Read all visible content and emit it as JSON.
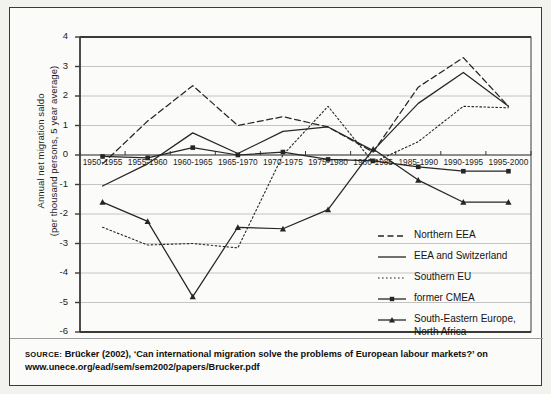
{
  "chart_data": {
    "type": "line",
    "title": "",
    "xlabel": "",
    "ylabel": "Annual net migration saldo (per thousand persons, 5 year average)",
    "ylabel_line1": "Annual net migration saldo",
    "ylabel_line2": "(per thousand persons, 5 year average)",
    "categories": [
      "1950-1955",
      "1955-1960",
      "1960-1965",
      "1965-1970",
      "1970-1975",
      "1975-1980",
      "1980-1985",
      "1985-1990",
      "1990-1995",
      "1995-2000"
    ],
    "ylim": [
      -6,
      4
    ],
    "yticks": [
      "4",
      "3",
      "2",
      "1",
      "0",
      "-1",
      "-2",
      "-3",
      "-4",
      "-5",
      "-6"
    ],
    "ytick_values": [
      4,
      3,
      2,
      1,
      0,
      -1,
      -2,
      -3,
      -4,
      -5,
      -6
    ],
    "grid": true,
    "grid_axis": "y",
    "legend_position": "lower-right-inside",
    "series": [
      {
        "name": "Northern EEA",
        "style": "dashed",
        "marker": "none",
        "color": "#262626",
        "values": [
          -0.3,
          1.15,
          2.35,
          1.0,
          1.3,
          0.95,
          0.1,
          2.3,
          3.3,
          1.65
        ]
      },
      {
        "name": "EEA and Switzerland",
        "style": "solid",
        "marker": "none",
        "color": "#262626",
        "values": [
          -1.05,
          -0.3,
          0.75,
          0.05,
          0.8,
          0.95,
          0.15,
          1.75,
          2.8,
          1.65
        ]
      },
      {
        "name": "Southern EU",
        "style": "dotted",
        "marker": "none",
        "color": "#262626",
        "values": [
          -2.45,
          -3.05,
          -3.0,
          -3.15,
          0.0,
          1.65,
          -0.25,
          0.45,
          1.65,
          1.6
        ]
      },
      {
        "name": "former CMEA",
        "style": "solid",
        "marker": "square",
        "color": "#262626",
        "values": [
          -0.05,
          -0.1,
          0.25,
          0.0,
          0.1,
          -0.15,
          -0.2,
          -0.4,
          -0.55,
          -0.55
        ]
      },
      {
        "name": "South-Eastern Europe, North Africa",
        "name_line1": "South-Eastern Europe,",
        "name_line2": "North Africa",
        "style": "solid",
        "marker": "triangle",
        "color": "#262626",
        "values": [
          -1.6,
          -2.25,
          -4.8,
          -2.45,
          -2.5,
          -1.85,
          0.2,
          -0.85,
          -1.6,
          -1.6
        ]
      }
    ]
  },
  "source": {
    "kicker": "SOURCE:",
    "line1": "Brücker (2002), ‘Can international migration solve the problems of European labour markets?’ on",
    "line2": "www.unece.org/ead/sem/sem2002/papers/Brucker.pdf"
  },
  "colors": {
    "ink": "#1b1b1b",
    "line": "#262626",
    "grid": "#c4c4c4",
    "axis": "#3a3a3a",
    "page_background": "#f2f2ef",
    "panel_background": "#fbfbf9"
  }
}
